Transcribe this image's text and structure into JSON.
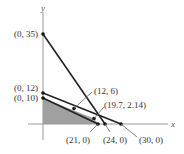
{
  "axes": {
    "x_label": "x",
    "y_label": "y"
  },
  "points": [
    {
      "label": "(0, 35)",
      "x": 0,
      "y": 35
    },
    {
      "label": "(0, 12)",
      "x": 0,
      "y": 12
    },
    {
      "label": "(0, 10)",
      "x": 0,
      "y": 10
    },
    {
      "label": "(12, 6)",
      "x": 12,
      "y": 6
    },
    {
      "label": "(19.7, 2.14)",
      "x": 19.7,
      "y": 2.14
    },
    {
      "label": "(21, 0)",
      "x": 21,
      "y": 0
    },
    {
      "label": "(24, 0)",
      "x": 24,
      "y": 0
    },
    {
      "label": "(30, 0)",
      "x": 30,
      "y": 0
    }
  ],
  "lines": [
    {
      "from": "(0, 35)",
      "to": "(24, 0)"
    },
    {
      "from": "(0, 12)",
      "to": "(30, 0)"
    },
    {
      "from": "(0, 10)",
      "to": "(21, 0)"
    }
  ],
  "feasible_region": {
    "vertices": [
      "(0, 0)",
      "(0, 10)",
      "(19.7, 2.14)",
      "(21, 0)"
    ],
    "color": "#9a9a9a"
  }
}
